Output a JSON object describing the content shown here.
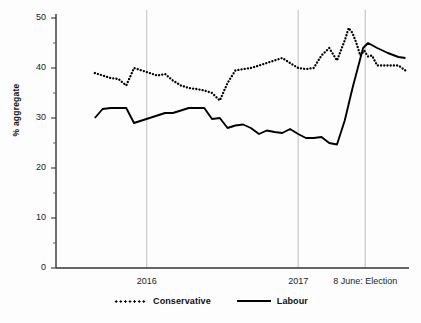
{
  "chart_data": {
    "type": "line",
    "title": "",
    "xlabel": "",
    "ylabel": "% aggregate",
    "ylim": [
      0,
      50
    ],
    "yticks": [
      0,
      10,
      20,
      30,
      40,
      50
    ],
    "yticks_minor": [
      5,
      15,
      25,
      35,
      45
    ],
    "xlim": [
      0,
      100
    ],
    "grid": "vertical gridlines at 2016, 2017 and 8 June: Election",
    "legend_position": "bottom-center",
    "xticks": [
      {
        "label": "2016",
        "pos": 25.7
      },
      {
        "label": "2017",
        "pos": 68.6
      },
      {
        "label": "8 June: Election",
        "pos": 87.6
      }
    ],
    "series": [
      {
        "name": "Conservative",
        "style": "dotted",
        "color": "#000000",
        "x": [
          11.0,
          13.2,
          15.5,
          17.7,
          19.9,
          22.1,
          24.3,
          26.5,
          28.7,
          30.9,
          33.1,
          35.4,
          37.6,
          39.8,
          42.0,
          44.2,
          46.4,
          48.6,
          50.8,
          53.0,
          55.2,
          57.5,
          59.7,
          61.9,
          64.1,
          66.3,
          68.6,
          70.8,
          73.0,
          75.2,
          77.4,
          79.6,
          80.7,
          81.8,
          82.9,
          84.0,
          85.1,
          86.2,
          87.3,
          88.4,
          89.5,
          91.0,
          93.0,
          95.0,
          97.0,
          99.0
        ],
        "y": [
          39.0,
          38.5,
          38.0,
          37.8,
          36.5,
          40.0,
          39.5,
          39.0,
          38.5,
          38.8,
          37.5,
          36.5,
          36.0,
          35.8,
          35.5,
          35.0,
          33.5,
          37.0,
          39.5,
          39.8,
          40.0,
          40.5,
          41.0,
          41.5,
          42.0,
          41.0,
          40.0,
          39.8,
          40.0,
          42.5,
          44.0,
          41.5,
          43.5,
          45.5,
          48.0,
          47.0,
          45.0,
          42.5,
          43.5,
          42.3,
          42.5,
          40.5,
          40.5,
          40.5,
          40.5,
          39.5
        ]
      },
      {
        "name": "Labour",
        "style": "solid",
        "color": "#000000",
        "x": [
          11.0,
          13.2,
          15.5,
          17.7,
          19.9,
          22.1,
          24.3,
          26.5,
          28.7,
          30.9,
          33.1,
          35.4,
          37.6,
          39.8,
          42.0,
          44.2,
          46.4,
          48.6,
          50.8,
          53.0,
          55.2,
          57.5,
          59.7,
          61.9,
          64.1,
          66.3,
          68.6,
          70.8,
          73.0,
          75.2,
          77.4,
          79.6,
          81.8,
          84.0,
          85.5,
          87.0,
          88.4,
          91.0,
          94.0,
          97.0,
          99.0
        ],
        "y": [
          30.0,
          31.8,
          32.0,
          32.0,
          32.0,
          29.0,
          29.5,
          30.0,
          30.5,
          31.0,
          31.0,
          31.5,
          32.0,
          32.0,
          32.0,
          29.8,
          30.0,
          28.0,
          28.5,
          28.7,
          28.0,
          26.8,
          27.5,
          27.2,
          27.0,
          27.8,
          26.8,
          26.0,
          26.0,
          26.2,
          25.0,
          24.7,
          29.5,
          36.0,
          40.0,
          44.0,
          45.0,
          44.0,
          43.0,
          42.2,
          42.0
        ]
      }
    ],
    "annotations": []
  },
  "axis": {
    "y_label": "% aggregate",
    "y_tick_labels": [
      "0",
      "10",
      "20",
      "30",
      "40",
      "50"
    ]
  },
  "legend": {
    "items": [
      {
        "label": "Conservative",
        "style": "dotted"
      },
      {
        "label": "Labour",
        "style": "solid"
      }
    ]
  }
}
